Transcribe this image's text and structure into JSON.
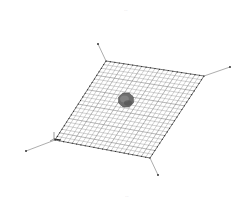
{
  "figure": {
    "top_label": "···",
    "bottom_label": "···",
    "colors": {
      "background": "#ffffff",
      "mesh_line": "#7a7a7a",
      "mesh_border": "#3a3a3a",
      "cable": "#8a8a8a",
      "node": "#222222",
      "body": "#6e6e6e",
      "body_dark": "#4f4f4f",
      "label": "#b8b8b8"
    },
    "mesh": {
      "corners": {
        "top_left": [
          106,
          61
        ],
        "top_right": [
          204,
          76
        ],
        "bottom_right": [
          150,
          158
        ],
        "bottom_left": [
          55,
          140
        ]
      },
      "divisions_u": 22,
      "divisions_v": 22
    },
    "cables": [
      {
        "name": "cable-top-left",
        "from": [
          106,
          61
        ],
        "to": [
          98,
          44
        ]
      },
      {
        "name": "cable-top-right",
        "from": [
          204,
          76
        ],
        "to": [
          230,
          67
        ]
      },
      {
        "name": "cable-bottom-right",
        "from": [
          150,
          158
        ],
        "to": [
          158,
          175
        ]
      },
      {
        "name": "cable-bottom-left",
        "from": [
          55,
          140
        ],
        "to": [
          26,
          151
        ]
      }
    ],
    "central_body": {
      "cx": 126,
      "cy": 100,
      "r": 8
    },
    "axis_triad": {
      "origin": [
        54,
        139
      ]
    }
  }
}
